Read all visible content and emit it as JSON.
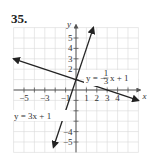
{
  "problem": {
    "number": "35."
  },
  "chart_data": {
    "type": "line",
    "title": "",
    "xlabel": "x",
    "ylabel": "y",
    "xlim": [
      -6,
      6
    ],
    "ylim": [
      -6,
      6
    ],
    "grid": true,
    "x_tick_labels": [
      "−5",
      "−3",
      "−1",
      "1",
      "2",
      "3",
      "4"
    ],
    "x_tick_values": [
      -5,
      -3,
      -1,
      1,
      2,
      3,
      4
    ],
    "y_tick_labels": [
      "5",
      "4",
      "3",
      "2",
      "−4",
      "−5"
    ],
    "y_tick_values": [
      5,
      4,
      3,
      2,
      -4,
      -5
    ],
    "series": [
      {
        "name": "y = 3x + 1",
        "slope": 3,
        "intercept": 1,
        "x": [
          -2.17,
          1.67
        ],
        "y": [
          -5.5,
          6.0
        ],
        "arrows": "both",
        "label": "y = 3x + 1"
      },
      {
        "name": "y = −(1/3)x + 1",
        "slope": -0.3333,
        "intercept": 1,
        "x": [
          -6,
          6
        ],
        "y": [
          3,
          -1
        ],
        "arrows": "both",
        "label_prefix": "y = −",
        "label_frac_num": "1",
        "label_frac_den": "3",
        "label_suffix": "x + 1"
      }
    ],
    "intersection": {
      "x": 0,
      "y": 1
    }
  },
  "colors": {
    "grid": "#d9d9d9",
    "axis": "#555555",
    "line": "#222222",
    "text": "#333333"
  }
}
